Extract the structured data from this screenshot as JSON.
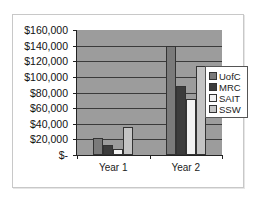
{
  "chart_data": {
    "type": "bar",
    "title": "",
    "xlabel": "",
    "ylabel": "",
    "categories": [
      "Year 1",
      "Year 2"
    ],
    "series": [
      {
        "name": "UofC",
        "color": "#7a7a7a",
        "values": [
          22000,
          140000
        ]
      },
      {
        "name": "MRC",
        "color": "#3c3c3c",
        "values": [
          13000,
          88000
        ]
      },
      {
        "name": "SAIT",
        "color": "#f2f2f2",
        "values": [
          8000,
          72000
        ]
      },
      {
        "name": "SSW",
        "color": "#c4c4c4",
        "values": [
          36000,
          114000
        ]
      }
    ],
    "ylim": [
      0,
      160000
    ],
    "yticks": [
      "$160,000",
      "$140,000",
      "$120,000",
      "$100,000",
      "$80,000",
      "$60,000",
      "$40,000",
      "$20,000",
      "$-"
    ],
    "grid": true,
    "legend_position": "right",
    "plot_background": "#9c9c9c"
  },
  "axis": {
    "y_labels": [
      "$160,000",
      "$140,000",
      "$120,000",
      "$100,000",
      "$80,000",
      "$60,000",
      "$40,000",
      "$20,000",
      "$-"
    ],
    "x_labels": [
      "Year 1",
      "Year 2"
    ]
  },
  "legend": {
    "items": [
      "UofC",
      "MRC",
      "SAIT",
      "SSW"
    ]
  }
}
